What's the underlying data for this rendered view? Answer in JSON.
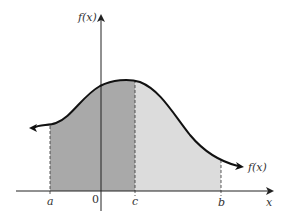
{
  "diagram": {
    "type": "probability-density-area",
    "y_axis_label": "f(x)",
    "x_axis_label": "x",
    "curve_label": "f(x)",
    "tick_labels": {
      "a": "a",
      "origin": "0",
      "c": "c",
      "b": "b"
    },
    "regions": [
      {
        "name": "a-to-c",
        "from": "a",
        "to": "c",
        "shade": "dark",
        "color": "#a9a9a9"
      },
      {
        "name": "c-to-b",
        "from": "c",
        "to": "b",
        "shade": "light",
        "color": "#dcdcdc"
      }
    ],
    "colors": {
      "curve": "#111111",
      "axis": "#222222",
      "dark_fill": "#a9a9a9",
      "light_fill": "#dcdcdc"
    }
  }
}
